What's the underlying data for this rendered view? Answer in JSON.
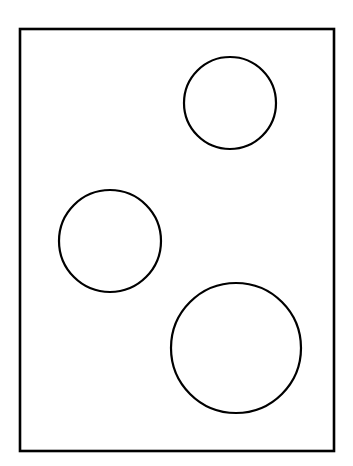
{
  "figure": {
    "title": "",
    "background_color": "#ffffff",
    "stroke_color": "#000000",
    "fill_color": "#ffffff",
    "width": 353,
    "height": 466,
    "clipped_caption_fragment": "ng of",
    "clipped_caption_color": "#b9b9b9"
  },
  "chart_data": {
    "type": "diagram",
    "title": "",
    "xlabel": "",
    "ylabel": "",
    "grid": false,
    "legend": null,
    "xlim": [
      0,
      353
    ],
    "ylim": [
      0,
      466
    ],
    "frame": {
      "name": "bounding-rectangle",
      "x": 20,
      "y": 29,
      "width": 314,
      "height": 422,
      "stroke": "#000000",
      "stroke_width": 2.6,
      "fill": "#ffffff"
    },
    "shapes": [
      {
        "name": "circle-top-right",
        "type": "circle",
        "cx": 230,
        "cy": 103,
        "r": 46,
        "stroke": "#000000",
        "stroke_width": 2.2,
        "fill": "#ffffff"
      },
      {
        "name": "circle-middle-left",
        "type": "circle",
        "cx": 110,
        "cy": 241,
        "r": 51,
        "stroke": "#000000",
        "stroke_width": 2.2,
        "fill": "#ffffff"
      },
      {
        "name": "circle-bottom-right",
        "type": "circle",
        "cx": 236,
        "cy": 348,
        "r": 65,
        "stroke": "#000000",
        "stroke_width": 2.2,
        "fill": "#ffffff"
      }
    ],
    "shape_count": 3,
    "annotations": []
  }
}
